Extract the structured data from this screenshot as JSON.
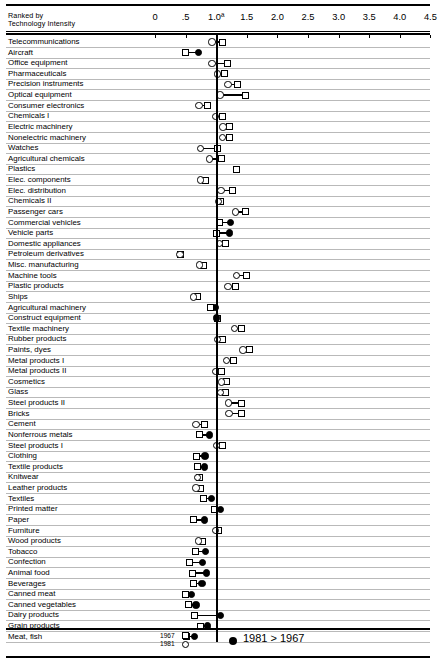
{
  "header": {
    "rank_label_line1": "Ranked by",
    "rank_label_line2": "Technology Intensity"
  },
  "legend": {
    "year_old": "1967",
    "year_new": "1981",
    "note": "1981 > 1967",
    "old_marker": "square-open",
    "new_marker": "circle-open",
    "increase_marker": "circle-filled"
  },
  "chart_data": {
    "type": "scatter",
    "title": "",
    "subtitle": "",
    "xlabel": "",
    "ylabel": "Ranked by Technology Intensity",
    "xlim": [
      0,
      4.5
    ],
    "xticks": [
      0,
      0.5,
      1.0,
      1.5,
      2.0,
      2.5,
      3.0,
      3.5,
      4.0,
      4.5
    ],
    "xticklabels": [
      "0",
      ".5",
      "1.0ª",
      "1.5",
      "2.0",
      "2.5",
      "3.0",
      "3.5",
      "4.0",
      "4.5"
    ],
    "reference_line": 1.0,
    "grid": "horizontal-rows",
    "legend_position": "bottom",
    "series": [
      {
        "name": "1967",
        "marker": "square-open"
      },
      {
        "name": "1981",
        "marker": "circle-open-or-filled"
      }
    ],
    "categories": [
      "Telecommunications",
      "Aircraft",
      "Office equipment",
      "Pharmaceuticals",
      "Precision instruments",
      "Optical equipment",
      "Consumer electronics",
      "Chemicals I",
      "Electric machinery",
      "Nonelectric machinery",
      "Watches",
      "Agricultural chemicals",
      "Plastics",
      "Elec. components",
      "Elec. distribution",
      "Chemicals II",
      "Passenger cars",
      "Commercial vehicles",
      "Vehicle parts",
      "Domestic appliances",
      "Petroleum derivatives",
      "Misc. manufacturing",
      "Machine tools",
      "Plastic products",
      "Ships",
      "Agricultural machinery",
      "Construct equipment",
      "Textile machinery",
      "Rubber products",
      "Paints, dyes",
      "Metal products I",
      "Metal products II",
      "Cosmetics",
      "Glass",
      "Steel products II",
      "Bricks",
      "Cement",
      "Nonferrous metals",
      "Steel products I",
      "Clothing",
      "Textile products",
      "Knitwear",
      "Leather products",
      "Textiles",
      "Printed matter",
      "Paper",
      "Furniture",
      "Wood products",
      "Tobacco",
      "Confection",
      "Animal food",
      "Beverages",
      "Canned meat",
      "Canned vegetables",
      "Dairy products",
      "Grain products",
      "Meat, fish"
    ],
    "rows": [
      {
        "label": "Telecommunications",
        "v1967": 1.1,
        "v1981": 0.93,
        "increase": false
      },
      {
        "label": "Aircraft",
        "v1967": 0.5,
        "v1981": 0.71,
        "increase": true
      },
      {
        "label": "Office equipment",
        "v1967": 1.19,
        "v1981": 0.93,
        "increase": false
      },
      {
        "label": "Pharmaceuticals",
        "v1967": 1.13,
        "v1981": 1.02,
        "increase": false
      },
      {
        "label": "Precision instruments",
        "v1967": 1.34,
        "v1981": 1.19,
        "increase": false
      },
      {
        "label": "Optical equipment",
        "v1967": 1.48,
        "v1981": 1.06,
        "increase": false
      },
      {
        "label": "Consumer electronics",
        "v1967": 0.86,
        "v1981": 0.72,
        "increase": false
      },
      {
        "label": "Chemicals I",
        "v1967": 1.1,
        "v1981": 0.99,
        "increase": false
      },
      {
        "label": "Electric machinery",
        "v1967": 1.21,
        "v1981": 1.11,
        "increase": false
      },
      {
        "label": "Nonelectric machinery",
        "v1967": 1.22,
        "v1981": 1.1,
        "increase": false
      },
      {
        "label": "Watches",
        "v1967": 1.02,
        "v1981": 0.74,
        "increase": false
      },
      {
        "label": "Agricultural chemicals",
        "v1967": 1.09,
        "v1981": 0.89,
        "increase": false
      },
      {
        "label": "Plastics",
        "v1967": 1.33,
        "v1981": 1.33,
        "increase": true
      },
      {
        "label": "Elec. components",
        "v1967": 0.82,
        "v1981": 0.74,
        "increase": false
      },
      {
        "label": "Elec. distribution",
        "v1967": 1.26,
        "v1981": 1.08,
        "increase": false
      },
      {
        "label": "Chemicals II",
        "v1967": 1.07,
        "v1981": 1.04,
        "increase": false
      },
      {
        "label": "Passenger cars",
        "v1967": 1.48,
        "v1981": 1.32,
        "increase": false
      },
      {
        "label": "Commercial vehicles",
        "v1967": 1.05,
        "v1981": 1.23,
        "increase": true
      },
      {
        "label": "Vehicle parts",
        "v1967": 1.01,
        "v1981": 1.22,
        "increase": true
      },
      {
        "label": "Domestic appliances",
        "v1967": 1.16,
        "v1981": 1.05,
        "increase": false
      },
      {
        "label": "Petroleum derivatives",
        "v1967": 0.42,
        "v1981": 0.41,
        "increase": false
      },
      {
        "label": "Misc. manufacturing",
        "v1967": 0.8,
        "v1981": 0.73,
        "increase": false
      },
      {
        "label": "Machine tools",
        "v1967": 1.5,
        "v1981": 1.33,
        "increase": false
      },
      {
        "label": "Plastic products",
        "v1967": 1.32,
        "v1981": 1.19,
        "increase": false
      },
      {
        "label": "Ships",
        "v1967": 0.69,
        "v1981": 0.63,
        "increase": false
      },
      {
        "label": "Agricultural machinery",
        "v1967": 0.9,
        "v1981": 0.98,
        "increase": true
      },
      {
        "label": "Construct equipment",
        "v1967": 1.02,
        "v1981": 1.0,
        "increase": true
      },
      {
        "label": "Textile machinery",
        "v1967": 1.41,
        "v1981": 1.3,
        "increase": false
      },
      {
        "label": "Rubber products",
        "v1967": 1.1,
        "v1981": 1.02,
        "increase": false
      },
      {
        "label": "Paints, dyes",
        "v1967": 1.55,
        "v1981": 1.44,
        "increase": false
      },
      {
        "label": "Metal products I",
        "v1967": 1.29,
        "v1981": 1.17,
        "increase": false
      },
      {
        "label": "Metal products II",
        "v1967": 1.08,
        "v1981": 0.99,
        "increase": false
      },
      {
        "label": "Cosmetics",
        "v1967": 1.17,
        "v1981": 1.09,
        "increase": false
      },
      {
        "label": "Glass",
        "v1967": 1.16,
        "v1981": 1.07,
        "increase": false
      },
      {
        "label": "Steel products II",
        "v1967": 1.42,
        "v1981": 1.2,
        "increase": false
      },
      {
        "label": "Bricks",
        "v1967": 1.42,
        "v1981": 1.21,
        "increase": false
      },
      {
        "label": "Cement",
        "v1967": 0.81,
        "v1981": 0.67,
        "increase": false
      },
      {
        "label": "Nonferrous metals",
        "v1967": 0.73,
        "v1981": 0.89,
        "increase": true
      },
      {
        "label": "Steel products I",
        "v1967": 1.1,
        "v1981": 1.0,
        "increase": false
      },
      {
        "label": "Clothing",
        "v1967": 0.68,
        "v1981": 0.82,
        "increase": true
      },
      {
        "label": "Textile products",
        "v1967": 0.7,
        "v1981": 0.81,
        "increase": true
      },
      {
        "label": "Knitwear",
        "v1967": 0.73,
        "v1981": 0.69,
        "increase": false
      },
      {
        "label": "Leather products",
        "v1967": 0.74,
        "v1981": 0.67,
        "increase": false
      },
      {
        "label": "Textiles",
        "v1967": 0.79,
        "v1981": 0.92,
        "increase": true
      },
      {
        "label": "Printed matter",
        "v1967": 0.98,
        "v1981": 1.07,
        "increase": true
      },
      {
        "label": "Paper",
        "v1967": 0.63,
        "v1981": 0.81,
        "increase": true
      },
      {
        "label": "Furniture",
        "v1967": 1.03,
        "v1981": 0.99,
        "increase": false
      },
      {
        "label": "Wood products",
        "v1967": 0.77,
        "v1981": 0.71,
        "increase": false
      },
      {
        "label": "Tobacco",
        "v1967": 0.66,
        "v1981": 0.83,
        "increase": true
      },
      {
        "label": "Confection",
        "v1967": 0.56,
        "v1981": 0.78,
        "increase": true
      },
      {
        "label": "Animal food",
        "v1967": 0.61,
        "v1981": 0.84,
        "increase": true
      },
      {
        "label": "Beverages",
        "v1967": 0.63,
        "v1981": 0.77,
        "increase": true
      },
      {
        "label": "Canned meat",
        "v1967": 0.5,
        "v1981": 0.6,
        "increase": true
      },
      {
        "label": "Canned vegetables",
        "v1967": 0.54,
        "v1981": 0.67,
        "increase": true
      },
      {
        "label": "Dairy products",
        "v1967": 0.64,
        "v1981": 1.07,
        "increase": true
      },
      {
        "label": "Grain products",
        "v1967": 0.74,
        "v1981": 0.86,
        "increase": true
      },
      {
        "label": "Meat, fish",
        "v1967": 0.52,
        "v1981": 0.65,
        "increase": true
      }
    ]
  }
}
